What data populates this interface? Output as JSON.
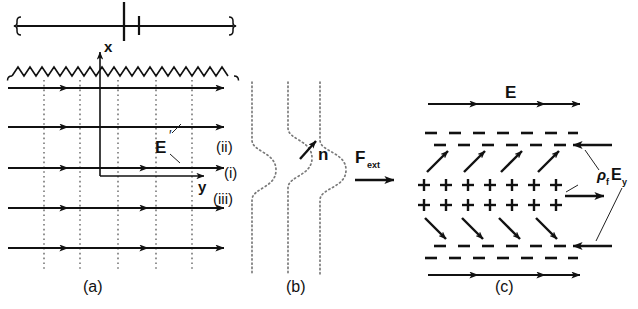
{
  "figure": {
    "ink_color": "#111111",
    "dotted_color": "#7a7a7a",
    "background": "#ffffff",
    "width": 638,
    "height": 309
  },
  "panel_a": {
    "caption": "(a)",
    "axis_x_label": "x",
    "axis_y_label": "y",
    "field_label": "E",
    "field_label_prime": "′",
    "field_lines_count": 5,
    "dotted_verticals_count": 5,
    "wavy_line": "sinusoidal wavetrain",
    "scalebar": "dimension bracket with center tick"
  },
  "panel_b": {
    "caption": "(b)",
    "curve_labels": [
      "(ii)",
      "(i)",
      "(iii)"
    ],
    "normal_label": "n",
    "force_label": "F",
    "force_subscript": "ext",
    "curves_count": 3
  },
  "panel_c": {
    "caption": "(c)",
    "field_label": "E",
    "force_label_rho": "ρ",
    "force_label_rho_sub": "f",
    "force_label_e": "E",
    "force_label_e_sub": "y",
    "plus_rows": 2,
    "plus_per_row": 7,
    "minus_rows_top": 2,
    "minus_rows_bottom": 2,
    "diagonal_arrows_up": 4,
    "diagonal_arrows_down": 4,
    "plus_symbol": "+",
    "minus_symbol": "−"
  }
}
